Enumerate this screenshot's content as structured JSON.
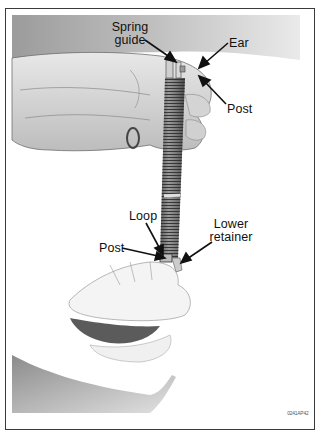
{
  "figure": {
    "callouts": [
      {
        "id": "spring-guide",
        "text_line1": "Spring",
        "text_line2": "guide"
      },
      {
        "id": "ear",
        "text": "Ear"
      },
      {
        "id": "post-upper",
        "text": "Post"
      },
      {
        "id": "loop",
        "text": "Loop"
      },
      {
        "id": "lower-retainer",
        "text_line1": "Lower",
        "text_line2": "retainer"
      },
      {
        "id": "post-lower",
        "text": "Post"
      }
    ],
    "figure_code": "0241AP42"
  }
}
